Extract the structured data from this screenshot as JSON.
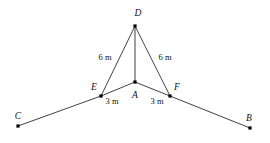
{
  "diagram": {
    "kind": "geometry-figure",
    "background_color": "#ffffff",
    "line_color": "#2b2b2b",
    "label_color": "#111111",
    "points": [
      {
        "id": "D",
        "label": "D",
        "x": 135,
        "y": 26,
        "label_x": 138,
        "label_y": 16,
        "label_anchor": "middle"
      },
      {
        "id": "A",
        "label": "A",
        "x": 135,
        "y": 82,
        "label_x": 135,
        "label_y": 98,
        "label_anchor": "middle"
      },
      {
        "id": "E",
        "label": "E",
        "x": 101,
        "y": 96,
        "label_x": 94,
        "label_y": 90,
        "label_anchor": "middle"
      },
      {
        "id": "F",
        "label": "F",
        "x": 170,
        "y": 96,
        "label_x": 177,
        "label_y": 90,
        "label_anchor": "middle"
      },
      {
        "id": "C",
        "label": "C",
        "x": 18,
        "y": 126,
        "label_x": 18,
        "label_y": 119,
        "label_anchor": "middle"
      },
      {
        "id": "B",
        "label": "B",
        "x": 250,
        "y": 128,
        "label_x": 249,
        "label_y": 121,
        "label_anchor": "middle"
      }
    ],
    "edges": [
      {
        "id": "D-E",
        "from": "D",
        "to": "E"
      },
      {
        "id": "D-A",
        "from": "D",
        "to": "A"
      },
      {
        "id": "D-F",
        "from": "D",
        "to": "F"
      },
      {
        "id": "C-E",
        "from": "C",
        "to": "E"
      },
      {
        "id": "E-A",
        "from": "E",
        "to": "A"
      },
      {
        "id": "A-F",
        "from": "A",
        "to": "F"
      },
      {
        "id": "F-B",
        "from": "F",
        "to": "B"
      }
    ],
    "measure_labels": [
      {
        "id": "DE-length",
        "text": "6 m",
        "x": 105,
        "y": 60,
        "anchor": "middle"
      },
      {
        "id": "DF-length",
        "text": "6 m",
        "x": 165,
        "y": 60,
        "anchor": "middle"
      },
      {
        "id": "EA-length",
        "text": "3 m",
        "x": 112,
        "y": 104,
        "anchor": "middle"
      },
      {
        "id": "AF-length",
        "text": "3 m",
        "x": 157,
        "y": 104,
        "anchor": "middle"
      }
    ]
  }
}
